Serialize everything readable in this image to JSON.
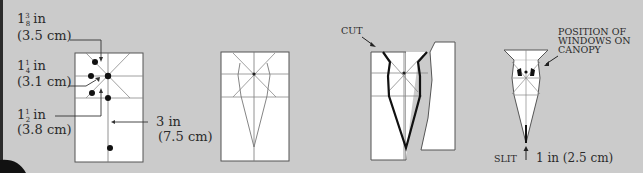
{
  "diagram": {
    "step1": {
      "dim_top": {
        "value": "1",
        "num": "3",
        "den": "8",
        "unit": "in",
        "metric": "(3.5 cm)"
      },
      "dim_mid": {
        "value": "1",
        "num": "1",
        "den": "4",
        "unit": "in",
        "metric": "(3.1 cm)"
      },
      "dim_low": {
        "value": "1",
        "num": "1",
        "den": "2",
        "unit": "in",
        "metric": "(3.8 cm)"
      },
      "dim_right": {
        "imperial": "3 in",
        "metric": "(7.5 cm)"
      }
    },
    "step3": {
      "cut_label": "CUT"
    },
    "step4": {
      "windows_label": [
        "POSITION OF",
        "WINDOWS ON",
        "CANOPY"
      ],
      "slit_label": "SLIT",
      "slit_length": "1 in (2.5 cm)"
    }
  },
  "colors": {
    "background": "#cbcbcb",
    "paper": "#ffffff",
    "ink": "#2a2a2a",
    "fold_line": "#8a8a8a",
    "edge_bar": "#2b2b2b"
  }
}
